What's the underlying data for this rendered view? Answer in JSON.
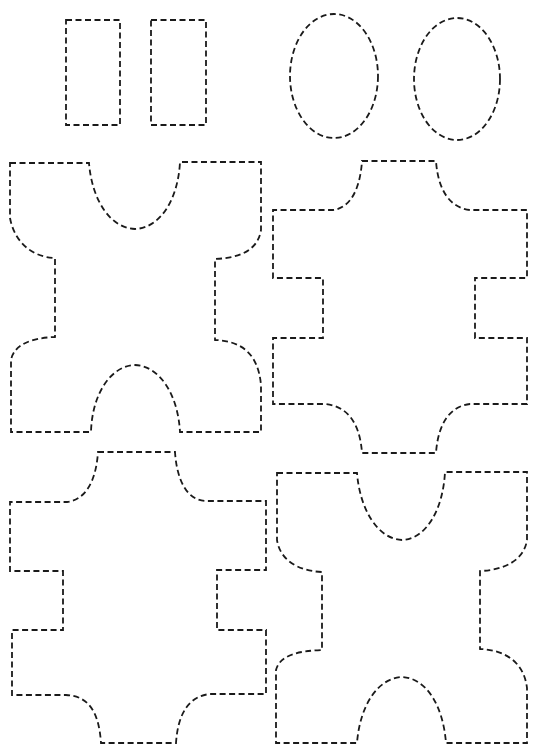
{
  "page": {
    "title": "",
    "background": "#ffffff",
    "stroke_color": "#1a1a1a",
    "line_style": "dashed"
  },
  "shapes": {
    "rectangles": [
      {
        "id": "rect-1",
        "x": 66,
        "y": 20,
        "w": 54,
        "h": 105
      },
      {
        "id": "rect-2",
        "x": 151,
        "y": 20,
        "w": 55,
        "h": 105
      }
    ],
    "ellipses": [
      {
        "id": "oval-1",
        "cx": 334,
        "cy": 76,
        "rx": 44,
        "ry": 62
      },
      {
        "id": "oval-2",
        "cx": 457,
        "cy": 79,
        "rx": 43,
        "ry": 61
      }
    ],
    "puzzle_pieces": [
      {
        "id": "piece-top-left",
        "type": "concave-top-convex-bottom"
      },
      {
        "id": "piece-top-right",
        "type": "cross-with-side-notches"
      },
      {
        "id": "piece-bottom-left",
        "type": "cross-with-side-notches"
      },
      {
        "id": "piece-bottom-right",
        "type": "concave-top-convex-bottom"
      }
    ]
  }
}
